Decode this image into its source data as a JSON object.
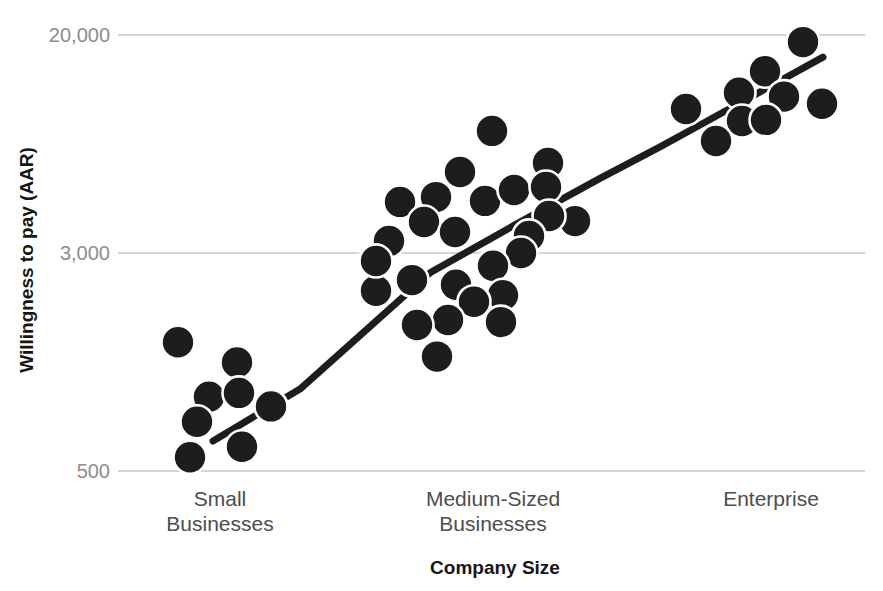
{
  "chart_data": {
    "type": "scatter",
    "title": "",
    "xlabel": "Company Size",
    "ylabel": "Willingness to pay (AAR)",
    "y_scale": "log",
    "y_axis_range": [
      450,
      22000
    ],
    "grid": "horizontal-only",
    "legend": "none",
    "y_ticks": [
      {
        "label": "20,000",
        "value": 20000
      },
      {
        "label": "3,000",
        "value": 3000
      },
      {
        "label": "500",
        "value": 500
      }
    ],
    "categories": [
      {
        "id": "small",
        "label_lines": [
          "Small",
          "Businesses"
        ]
      },
      {
        "id": "medium",
        "label_lines": [
          "Medium-Sized",
          "Businesses"
        ]
      },
      {
        "id": "enterprise",
        "label_lines": [
          "Enterprise"
        ]
      }
    ],
    "points": [
      {
        "category": "small",
        "x": 178,
        "value": 1440
      },
      {
        "category": "small",
        "x": 237,
        "value": 1220
      },
      {
        "category": "small",
        "x": 209,
        "value": 920
      },
      {
        "category": "small",
        "x": 239,
        "value": 950
      },
      {
        "category": "small",
        "x": 197,
        "value": 750
      },
      {
        "category": "small",
        "x": 271,
        "value": 850
      },
      {
        "category": "small",
        "x": 242,
        "value": 610
      },
      {
        "category": "small",
        "x": 190,
        "value": 560
      },
      {
        "category": "medium",
        "x": 492,
        "value": 8680
      },
      {
        "category": "medium",
        "x": 460,
        "value": 6070
      },
      {
        "category": "medium",
        "x": 548,
        "value": 6570
      },
      {
        "category": "medium",
        "x": 400,
        "value": 4680
      },
      {
        "category": "medium",
        "x": 436,
        "value": 4880
      },
      {
        "category": "medium",
        "x": 485,
        "value": 4720
      },
      {
        "category": "medium",
        "x": 514,
        "value": 5190
      },
      {
        "category": "medium",
        "x": 546,
        "value": 5330
      },
      {
        "category": "medium",
        "x": 424,
        "value": 3930
      },
      {
        "category": "medium",
        "x": 455,
        "value": 3600
      },
      {
        "category": "medium",
        "x": 389,
        "value": 3330
      },
      {
        "category": "medium",
        "x": 375,
        "value": 2810
      },
      {
        "category": "medium",
        "x": 575,
        "value": 3960
      },
      {
        "category": "medium",
        "x": 549,
        "value": 4140
      },
      {
        "category": "medium",
        "x": 529,
        "value": 3480
      },
      {
        "category": "medium",
        "x": 521,
        "value": 3000
      },
      {
        "category": "medium",
        "x": 493,
        "value": 2700
      },
      {
        "category": "medium",
        "x": 412,
        "value": 2400
      },
      {
        "category": "medium",
        "x": 376,
        "value": 2200
      },
      {
        "category": "medium",
        "x": 456,
        "value": 2310
      },
      {
        "category": "medium",
        "x": 503,
        "value": 2120
      },
      {
        "category": "medium",
        "x": 474,
        "value": 2010
      },
      {
        "category": "medium",
        "x": 448,
        "value": 1730
      },
      {
        "category": "medium",
        "x": 417,
        "value": 1660
      },
      {
        "category": "medium",
        "x": 501,
        "value": 1700
      },
      {
        "category": "medium",
        "x": 437,
        "value": 1280
      },
      {
        "category": "enterprise",
        "x": 803,
        "value": 18800
      },
      {
        "category": "enterprise",
        "x": 765,
        "value": 14600
      },
      {
        "category": "enterprise",
        "x": 739,
        "value": 12100
      },
      {
        "category": "enterprise",
        "x": 784,
        "value": 11700
      },
      {
        "category": "enterprise",
        "x": 686,
        "value": 10500
      },
      {
        "category": "enterprise",
        "x": 822,
        "value": 11000
      },
      {
        "category": "enterprise",
        "x": 742,
        "value": 9460
      },
      {
        "category": "enterprise",
        "x": 766,
        "value": 9550
      },
      {
        "category": "enterprise",
        "x": 716,
        "value": 7950
      },
      {
        "category": "medium",
        "x": 376,
        "value": 2810
      }
    ],
    "trendline": {
      "shape": "rising-left-to-right",
      "points": [
        {
          "x": 213,
          "value": 640
        },
        {
          "x": 300,
          "value": 980
        },
        {
          "x": 430,
          "value": 2550
        },
        {
          "x": 515,
          "value": 3830
        },
        {
          "x": 600,
          "value": 5740
        },
        {
          "x": 660,
          "value": 7550
        },
        {
          "x": 700,
          "value": 9140
        },
        {
          "x": 823,
          "value": 16500
        }
      ]
    }
  },
  "style": {
    "background": "#ffffff",
    "dot_color": "#1d1d1d",
    "dot_outline": "#ffffff",
    "trend_color": "#1d1d1d",
    "grid_color": "#ababab",
    "tick_text_color": "#8d8d8d",
    "category_text_color": "#4d4d4d",
    "axis_title_color": "#161616"
  }
}
